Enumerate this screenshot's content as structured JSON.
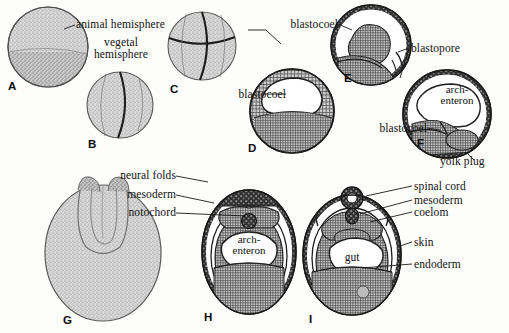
{
  "figure": {
    "background_color": "#fdfdfb",
    "ink_color": "#121212",
    "cell_fill": "#c9c9c9",
    "dark_fill": "#3a3a3a",
    "stipple_fill": "#cfcfcf"
  },
  "panels": [
    {
      "id": "A",
      "letter": "A",
      "name": "uncleaved-egg"
    },
    {
      "id": "B",
      "letter": "B",
      "name": "two-cell-stage"
    },
    {
      "id": "C",
      "letter": "C",
      "name": "four-cell-stage"
    },
    {
      "id": "D",
      "letter": "D",
      "name": "blastula"
    },
    {
      "id": "E",
      "letter": "E",
      "name": "early-gastrula"
    },
    {
      "id": "F",
      "letter": "F",
      "name": "late-gastrula"
    },
    {
      "id": "G",
      "letter": "G",
      "name": "neurula-external"
    },
    {
      "id": "H",
      "letter": "H",
      "name": "neurula-section"
    },
    {
      "id": "I",
      "letter": "I",
      "name": "tailbud-section"
    }
  ],
  "labels": {
    "animal_hemisphere": "animal hemisphere",
    "vegetal_hemisphere_line1": "vegetal",
    "vegetal_hemisphere_line2": "hemisphere",
    "blastocoel_d": "blastocoel",
    "blastocoel_e": "blastocoel",
    "blastocoel_f": "blastocoel",
    "blastopore": "blastopore",
    "archenteron_f_line1": "arch-",
    "archenteron_f_line2": "enteron",
    "yolk_plug": "yolk plug",
    "neural_folds": "neural folds",
    "mesoderm_h": "mesoderm",
    "notochord": "notochord",
    "archenteron_h_line1": "arch-",
    "archenteron_h_line2": "enteron",
    "spinal_cord": "spinal cord",
    "mesoderm_i": "mesoderm",
    "coelom": "coelom",
    "gut": "gut",
    "skin": "skin",
    "endoderm": "endoderm"
  }
}
